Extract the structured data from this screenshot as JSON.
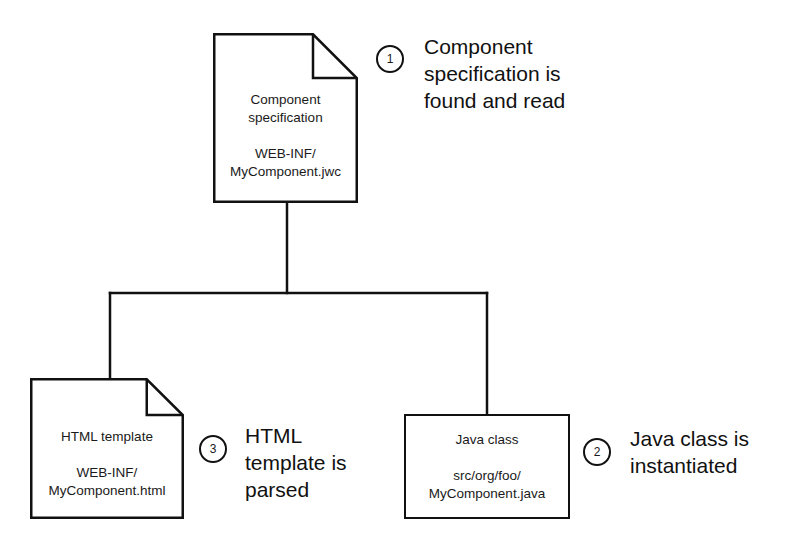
{
  "diagram": {
    "background_color": "#ffffff",
    "stroke_color": "#111111",
    "nodes": [
      {
        "id": "component-spec",
        "shape": "document",
        "title": "Component\nspecification",
        "path": "WEB-INF/\nMyComponent.jwc",
        "x": 213,
        "y": 33,
        "width": 145,
        "height": 170,
        "fold": 45
      },
      {
        "id": "html-template",
        "shape": "document",
        "title": "HTML template",
        "path": "WEB-INF/\nMyComponent.html",
        "x": 30,
        "y": 378,
        "width": 154,
        "height": 141,
        "fold": 36
      },
      {
        "id": "java-class",
        "shape": "rectangle",
        "title": "Java class",
        "path": "src/org/foo/\nMyComponent.java",
        "x": 404,
        "y": 414,
        "width": 166,
        "height": 105
      }
    ],
    "badges": [
      {
        "id": "badge-1",
        "number": "1",
        "x": 376,
        "y": 45
      },
      {
        "id": "badge-2",
        "number": "2",
        "x": 583,
        "y": 438
      },
      {
        "id": "badge-3",
        "number": "3",
        "x": 199,
        "y": 435
      }
    ],
    "captions": [
      {
        "id": "caption-1",
        "text": "Component\nspecification is\nfound and read",
        "x": 424,
        "y": 33
      },
      {
        "id": "caption-2",
        "text": "Java class is\ninstantiated",
        "x": 630,
        "y": 425
      },
      {
        "id": "caption-3",
        "text": "HTML\ntemplate is\nparsed",
        "x": 245,
        "y": 422
      }
    ],
    "connectors": {
      "description": "Vertical trunk from component specification down to a horizontal bus that branches to the HTML template and the Java class.",
      "trunk_x": 287,
      "trunk_top": 203,
      "bus_y": 293,
      "bus_left_x": 110,
      "bus_right_x": 487,
      "left_branch_bottom": 379,
      "right_branch_bottom": 415
    }
  }
}
